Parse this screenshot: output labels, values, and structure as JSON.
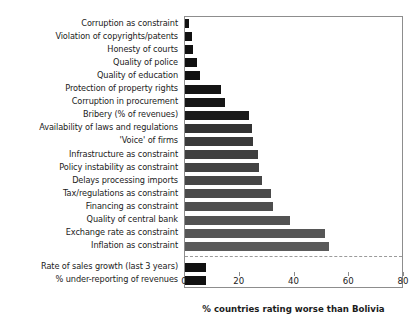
{
  "chart_data": {
    "type": "bar",
    "orientation": "horizontal",
    "title": "",
    "xlabel": "% countries rating worse than Bolivia",
    "ylabel": "",
    "xlim": [
      0,
      80
    ],
    "xticks": [
      0,
      20,
      40,
      60,
      80
    ],
    "xtick_labels": [
      "0",
      "20",
      "40",
      "60",
      "80"
    ],
    "grid": false,
    "legend": false,
    "categories": [
      "Corruption as constraint",
      "Violation of copyrights/patents",
      "Honesty of courts",
      "Quality of police",
      "Quality of education",
      "Protection of property rights",
      "Corruption in procurement",
      "Bribery (% of revenues)",
      "Availability of laws and regulations",
      "'Voice' of firms",
      "Infrastructure as constraint",
      "Policy instability as constraint",
      "Delays processing imports",
      "Tax/regulations as constraint",
      "Financing as constraint",
      "Quality of central bank",
      "Exchange rate as constraint",
      "Inflation as constraint",
      "Rate of sales growth (last 3 years)",
      "% under-reporting of revenues"
    ],
    "values": [
      1.5,
      2.5,
      3.0,
      4.5,
      5.5,
      13.0,
      14.5,
      23.5,
      24.5,
      25.0,
      26.5,
      27.0,
      28.0,
      31.5,
      32.0,
      38.5,
      51.0,
      52.5,
      7.7,
      7.7
    ],
    "bar_colors": [
      "#111111",
      "#111111",
      "#111111",
      "#111111",
      "#111111",
      "#141414",
      "#161616",
      "#1a1a1a",
      "#333333",
      "#3a3a3a",
      "#404040",
      "#434343",
      "#464646",
      "#4a4a4a",
      "#4e4e4e",
      "#525252",
      "#565656",
      "#5a5a5a",
      "#111111",
      "#111111"
    ],
    "group_divider_after_index": 17,
    "annotations": []
  },
  "axis": {
    "frame_color": "#8d8d8d",
    "tick_color": "#8d8d8d"
  }
}
